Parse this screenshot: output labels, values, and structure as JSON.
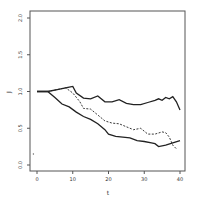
{
  "chart_data": {
    "type": "line",
    "title": "",
    "xlabel": "t",
    "ylabel": "J",
    "xlim": [
      -2,
      42
    ],
    "ylim": [
      -0.1,
      2.05
    ],
    "xticks": [
      "0",
      "10",
      "20",
      "30",
      "40"
    ],
    "yticks": [
      "0.0",
      "0.5",
      "1.0",
      "1.5",
      "2.0"
    ],
    "grid": false,
    "legend": null,
    "series": [
      {
        "name": "upper-solid",
        "style": "solid",
        "x": [
          0,
          3,
          6,
          9,
          10,
          11,
          13,
          15,
          17,
          19,
          21,
          23,
          25,
          27,
          29,
          31,
          33,
          34,
          35,
          36,
          37,
          38,
          39,
          40
        ],
        "y": [
          1.0,
          1.0,
          1.03,
          1.06,
          1.07,
          0.98,
          0.91,
          0.9,
          0.94,
          0.86,
          0.86,
          0.89,
          0.84,
          0.82,
          0.82,
          0.85,
          0.88,
          0.9,
          0.88,
          0.92,
          0.9,
          0.93,
          0.86,
          0.75
        ]
      },
      {
        "name": "dashed",
        "style": "dashed",
        "x": [
          0,
          3,
          6,
          8,
          10,
          12,
          13,
          15,
          17,
          19,
          21,
          23,
          25,
          27,
          29,
          31,
          33,
          35,
          36,
          37,
          38,
          39
        ],
        "y": [
          1.0,
          1.0,
          1.03,
          1.05,
          0.98,
          0.86,
          0.77,
          0.76,
          0.68,
          0.6,
          0.57,
          0.56,
          0.52,
          0.48,
          0.5,
          0.42,
          0.42,
          0.45,
          0.44,
          0.38,
          0.27,
          0.22
        ]
      },
      {
        "name": "lower-solid",
        "style": "solid",
        "x": [
          0,
          3,
          5,
          7,
          9,
          11,
          13,
          15,
          17,
          19,
          20,
          22,
          24,
          26,
          28,
          30,
          32,
          33,
          34,
          36,
          38,
          40
        ],
        "y": [
          1.0,
          1.0,
          0.92,
          0.83,
          0.79,
          0.72,
          0.66,
          0.62,
          0.56,
          0.48,
          0.42,
          0.39,
          0.38,
          0.37,
          0.33,
          0.32,
          0.3,
          0.29,
          0.25,
          0.27,
          0.3,
          0.33
        ]
      }
    ],
    "annotations": [
      {
        "type": "point",
        "x": -1,
        "y": 0.15
      }
    ]
  }
}
